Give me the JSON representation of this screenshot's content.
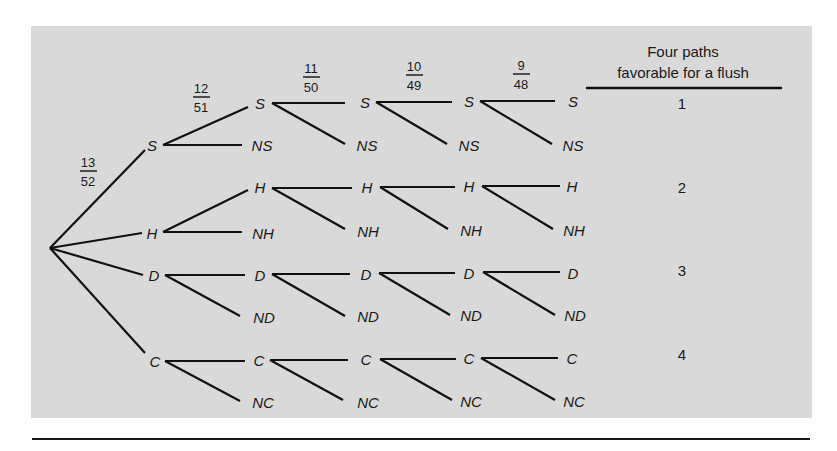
{
  "figure": {
    "root_label": "",
    "probabilities": [
      "13/52",
      "12/51",
      "11/50",
      "10/49",
      "9/48"
    ],
    "prob_parts": [
      {
        "num": "13",
        "den": "52"
      },
      {
        "num": "12",
        "den": "51"
      },
      {
        "num": "11",
        "den": "50"
      },
      {
        "num": "10",
        "den": "49"
      },
      {
        "num": "9",
        "den": "48"
      }
    ],
    "header": {
      "line1": "Four paths",
      "line2": "favorable  for a flush"
    },
    "suits": [
      {
        "suit": "S",
        "not": "NS",
        "count": "1"
      },
      {
        "suit": "H",
        "not": "NH",
        "count": "2"
      },
      {
        "suit": "D",
        "not": "ND",
        "count": "3"
      },
      {
        "suit": "C",
        "not": "NC",
        "count": "4"
      }
    ],
    "colors": {
      "panel": "#d9d9d9",
      "ink": "#1a1a1a",
      "background": "#ffffff"
    }
  }
}
